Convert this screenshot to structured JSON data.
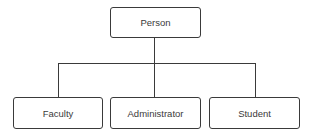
{
  "diagram": {
    "type": "hierarchy",
    "root": {
      "label": "Person"
    },
    "children": [
      {
        "label": "Faculty"
      },
      {
        "label": "Administrator"
      },
      {
        "label": "Student"
      }
    ],
    "colors": {
      "stroke": "#3a3a3a",
      "text": "#3a3a3a",
      "background": "#ffffff"
    }
  }
}
